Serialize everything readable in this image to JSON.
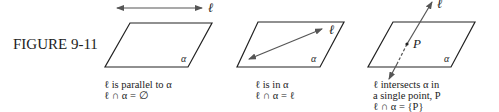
{
  "figure_label": "FIGURE 9-11",
  "symbols": {
    "line": "ℓ",
    "plane": "α",
    "point": "P"
  },
  "panels": [
    {
      "caption_line1": "ℓ is parallel to α",
      "caption_line2": "ℓ ∩ α = ∅",
      "caption_line3": ""
    },
    {
      "caption_line1": "ℓ is in α",
      "caption_line2": "ℓ ∩ α = ℓ",
      "caption_line3": ""
    },
    {
      "caption_line1": "ℓ intersects α in",
      "caption_line2": "a single point, P",
      "caption_line3": "ℓ ∩ α = {P}"
    }
  ],
  "colors": {
    "ink": "#222222",
    "line": "#555555",
    "background": "#ffffff"
  }
}
